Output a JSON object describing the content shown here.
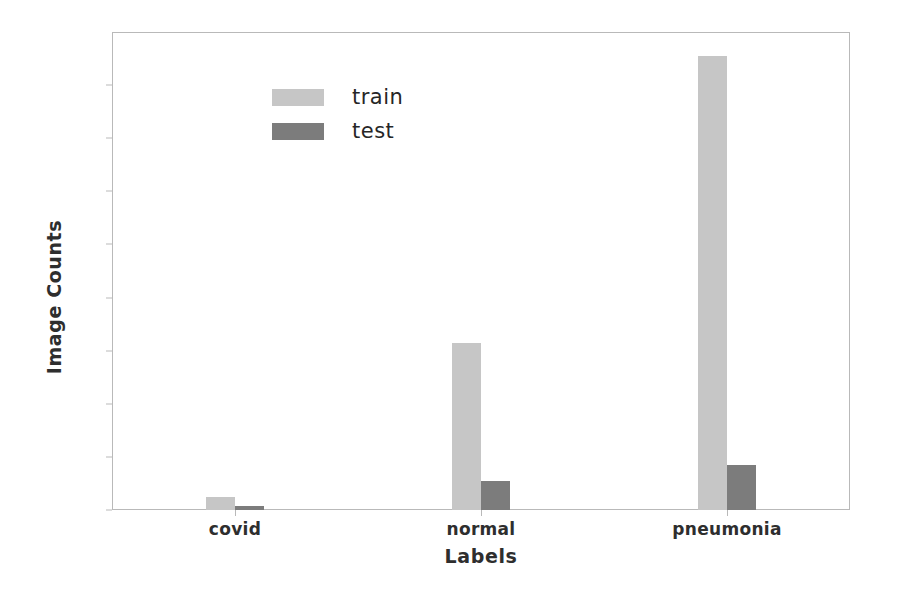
{
  "chart_data": {
    "type": "bar",
    "title": "",
    "xlabel": "Labels",
    "ylabel": "Image Counts",
    "categories": [
      "covid",
      "normal",
      "pneumonia"
    ],
    "series": [
      {
        "name": "train",
        "values": [
          120,
          1575,
          4270
        ],
        "color": "#c6c6c6"
      },
      {
        "name": "test",
        "values": [
          35,
          275,
          425
        ],
        "color": "#7c7c7c"
      }
    ],
    "ylim": [
      0,
      4500
    ],
    "yticks": [
      0,
      500,
      1000,
      1500,
      2000,
      2500,
      3000,
      3500,
      4000
    ],
    "ytick_labels": [
      "0",
      "500",
      "1000",
      "1500",
      "2000",
      "2500",
      "3000",
      "3500",
      "4000"
    ],
    "grid": false,
    "legend_position": "upper left",
    "legend_entries": [
      "train",
      "test"
    ]
  },
  "axes": {
    "y_label": "Image Counts",
    "x_label": "Labels",
    "y_ticks": [
      "0",
      "500",
      "1000",
      "1500",
      "2000",
      "2500",
      "3000",
      "3500",
      "4000"
    ],
    "x_ticks": [
      "covid",
      "normal",
      "pneumonia"
    ]
  },
  "legend": {
    "train_label": "train",
    "test_label": "test",
    "train_color": "#c6c6c6",
    "test_color": "#7c7c7c"
  }
}
